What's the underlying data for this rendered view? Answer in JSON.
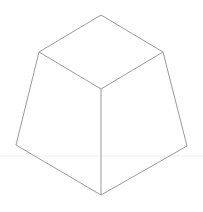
{
  "diagram": {
    "type": "frustum-line-drawing",
    "stroke_color": "#9a9a9a",
    "guide_color": "#ececec",
    "background": "#ffffff",
    "vertices": {
      "top": [
        101,
        15
      ],
      "upper_left": [
        39,
        52
      ],
      "upper_right": [
        163,
        52
      ],
      "center": [
        101,
        89
      ],
      "lower_left": [
        16,
        145
      ],
      "lower_right": [
        187,
        146
      ],
      "bottom": [
        101,
        195
      ]
    }
  }
}
